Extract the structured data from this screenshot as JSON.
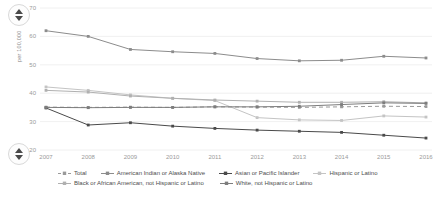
{
  "controls": {
    "scroll_up_top": "scroll-up",
    "scroll_down_top": "scroll-down",
    "scroll_up_bottom": "scroll-up",
    "scroll_down_bottom": "scroll-down"
  },
  "chart_data": {
    "type": "line",
    "title": "",
    "xlabel": "",
    "ylabel": "per 100,000",
    "ylim": [
      20,
      70
    ],
    "yticks": [
      20,
      30,
      40,
      50,
      60,
      70
    ],
    "grid": true,
    "legend_position": "bottom",
    "categories": [
      "2007",
      "2008",
      "2009",
      "2010",
      "2011",
      "2012",
      "2013",
      "2014",
      "2015",
      "2016"
    ],
    "x": [
      2007,
      2008,
      2009,
      2010,
      2011,
      2012,
      2013,
      2014,
      2015,
      2016
    ],
    "series": [
      {
        "name": "Total",
        "color": "#9a9a9a",
        "dash": "4 3",
        "marker": "square",
        "values": [
          35.1,
          35.0,
          35.1,
          35.0,
          35.2,
          35.1,
          35.0,
          35.2,
          35.4,
          35.3
        ]
      },
      {
        "name": "American Indian or Alaska Native",
        "color": "#8c8c8c",
        "dash": "none",
        "marker": "square",
        "values": [
          62.0,
          60.0,
          55.4,
          54.6,
          54.0,
          52.2,
          51.4,
          51.6,
          53.0,
          52.4
        ]
      },
      {
        "name": "Asian or Pacific Islander",
        "color": "#4a4a4a",
        "dash": "none",
        "marker": "square",
        "values": [
          34.8,
          28.8,
          29.6,
          28.4,
          27.6,
          27.0,
          26.6,
          26.2,
          25.2,
          24.2
        ]
      },
      {
        "name": "Hispanic or Latino",
        "color": "#c4c4c4",
        "dash": "none",
        "marker": "square",
        "values": [
          42.2,
          41.0,
          39.4,
          38.2,
          37.4,
          31.4,
          30.6,
          30.4,
          32.0,
          31.6
        ]
      },
      {
        "name": "Black or African American, not Hispanic or Latino",
        "color": "#b0b0b0",
        "dash": "none",
        "marker": "square",
        "values": [
          41.0,
          40.4,
          39.0,
          38.2,
          37.6,
          37.2,
          36.8,
          36.8,
          37.0,
          36.6
        ]
      },
      {
        "name": "White, not Hispanic or Latino",
        "color": "#7d7d7d",
        "dash": "none",
        "marker": "square",
        "values": [
          35.0,
          34.9,
          35.0,
          35.0,
          35.2,
          35.2,
          35.4,
          36.0,
          36.6,
          36.4
        ]
      }
    ]
  },
  "legend": {
    "row1": [
      "Total",
      "American Indian or Alaska Native",
      "Asian or Pacific Islander",
      "Hispanic or Latino"
    ],
    "row2": [
      "Black or African American, not Hispanic or Latino",
      "White, not Hispanic or Latino"
    ]
  }
}
